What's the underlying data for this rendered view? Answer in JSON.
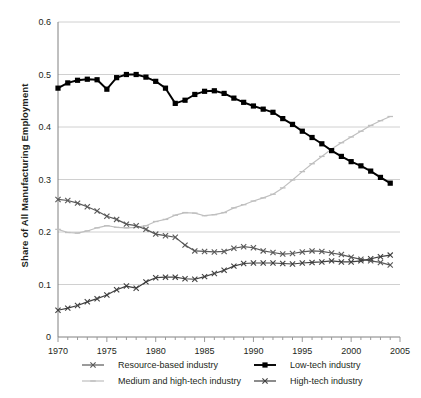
{
  "chart_data": {
    "type": "line",
    "title": "",
    "xlabel": "",
    "ylabel": "Share of All Manufacturing Employment",
    "xlim": [
      1970,
      2005
    ],
    "ylim": [
      0,
      0.6
    ],
    "grid": true,
    "legend_position": "bottom",
    "ytick_labels": [
      "0",
      "0.1",
      "0.2",
      "0.3",
      "0.4",
      "0.5",
      "0.6"
    ],
    "ytick_values": [
      0,
      0.1,
      0.2,
      0.3,
      0.4,
      0.5,
      0.6
    ],
    "xtick_labels": [
      "1970",
      "1975",
      "1980",
      "1985",
      "1990",
      "1995",
      "2000",
      "2005"
    ],
    "xtick_values": [
      1970,
      1975,
      1980,
      1985,
      1990,
      1995,
      2000,
      2005
    ],
    "x": [
      1970,
      1971,
      1972,
      1973,
      1974,
      1975,
      1976,
      1977,
      1978,
      1979,
      1980,
      1981,
      1982,
      1983,
      1984,
      1985,
      1986,
      1987,
      1988,
      1989,
      1990,
      1991,
      1992,
      1993,
      1994,
      1995,
      1996,
      1997,
      1998,
      1999,
      2000,
      2001,
      2002,
      2003,
      2004
    ],
    "series": [
      {
        "name": "Resource-based industry",
        "color": "#595959",
        "marker": "cross",
        "values": [
          0.262,
          0.26,
          0.255,
          0.248,
          0.24,
          0.23,
          0.224,
          0.215,
          0.212,
          0.205,
          0.196,
          0.193,
          0.19,
          0.175,
          0.164,
          0.163,
          0.162,
          0.163,
          0.169,
          0.172,
          0.17,
          0.164,
          0.161,
          0.158,
          0.159,
          0.162,
          0.164,
          0.163,
          0.16,
          0.157,
          0.152,
          0.148,
          0.145,
          0.142,
          0.137
        ]
      },
      {
        "name": "Low-tech industry",
        "color": "#000000",
        "marker": "square",
        "values": [
          0.474,
          0.484,
          0.489,
          0.491,
          0.49,
          0.472,
          0.494,
          0.5,
          0.5,
          0.495,
          0.487,
          0.474,
          0.445,
          0.451,
          0.462,
          0.468,
          0.469,
          0.464,
          0.455,
          0.447,
          0.44,
          0.434,
          0.428,
          0.416,
          0.405,
          0.392,
          0.38,
          0.368,
          0.355,
          0.344,
          0.334,
          0.326,
          0.316,
          0.304,
          0.293
        ]
      },
      {
        "name": "Medium and high-tech industry",
        "color": "#bfbfbf",
        "marker": "dash",
        "values": [
          0.205,
          0.199,
          0.198,
          0.202,
          0.208,
          0.212,
          0.209,
          0.208,
          0.209,
          0.212,
          0.22,
          0.224,
          0.232,
          0.237,
          0.236,
          0.231,
          0.233,
          0.237,
          0.246,
          0.252,
          0.259,
          0.265,
          0.272,
          0.284,
          0.299,
          0.315,
          0.33,
          0.344,
          0.358,
          0.37,
          0.381,
          0.392,
          0.403,
          0.412,
          0.42
        ]
      },
      {
        "name": "High-tech industry",
        "color": "#404040",
        "marker": "cross",
        "values": [
          0.051,
          0.055,
          0.06,
          0.067,
          0.073,
          0.08,
          0.09,
          0.097,
          0.093,
          0.105,
          0.113,
          0.114,
          0.114,
          0.111,
          0.11,
          0.115,
          0.121,
          0.127,
          0.135,
          0.14,
          0.141,
          0.141,
          0.141,
          0.14,
          0.139,
          0.141,
          0.142,
          0.143,
          0.145,
          0.143,
          0.143,
          0.145,
          0.149,
          0.153,
          0.156
        ]
      }
    ]
  },
  "legend": {
    "items": [
      {
        "label": "Resource-based industry"
      },
      {
        "label": "Low-tech industry"
      },
      {
        "label": "Medium and high-tech industry"
      },
      {
        "label": "High-tech industry"
      }
    ]
  }
}
